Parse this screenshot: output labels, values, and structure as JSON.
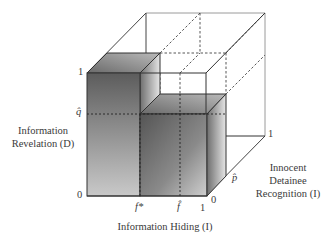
{
  "diagram": {
    "type": "3d-cube-region",
    "axes": {
      "x": {
        "label": "Information Hiding (I)",
        "ticks": [
          "0",
          "f*",
          "f̂",
          "1"
        ]
      },
      "y": {
        "label_line1": "Information",
        "label_line2": "Revelation (D)",
        "ticks": [
          "0",
          "q̂",
          "1"
        ]
      },
      "z": {
        "label_line1": "Innocent",
        "label_line2": "Detainee",
        "label_line3": "Recognition (I)",
        "ticks": [
          "0",
          "p̂",
          "1"
        ]
      }
    },
    "tick_labels": {
      "y_one": "1",
      "y_qhat": "q̂",
      "y_zero": "0",
      "x_fstar": "f*",
      "x_fhat": "f̂",
      "x_one": "1",
      "z_zero": "0",
      "z_phat": "p̂",
      "z_one": "1"
    },
    "colors": {
      "edge": "#3a3a3a",
      "outer_edge": "#8a8a8a",
      "shade_dark": "#5a5a5a",
      "shade_light": "#d8d8d8"
    }
  }
}
